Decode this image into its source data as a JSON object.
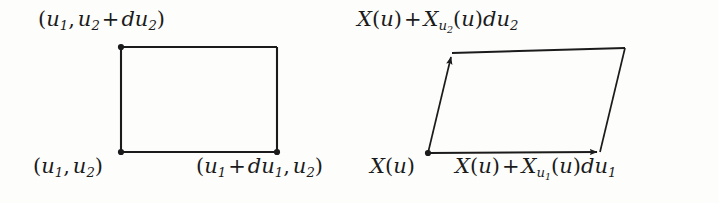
{
  "figure": {
    "background_color": "#fdfdfb",
    "stroke_color": "#1b1b1b"
  },
  "left_diagram": {
    "name": "parameter-domain-rectangle",
    "shape": "rectangle",
    "labels": {
      "top_left": "(u1, u2 + du2)",
      "bottom_left": "(u1, u2)",
      "bottom_right": "(u1 + du1, u2)"
    },
    "geometry": {
      "x_left": 121,
      "x_right": 277,
      "y_top": 47,
      "y_bottom": 152,
      "corner_dot_radius": 3
    }
  },
  "right_diagram": {
    "name": "tangent-plane-parallelogram",
    "shape": "parallelogram",
    "labels": {
      "top_left": "X(u) + Xu2(u)du2",
      "bottom_left": "X(u)",
      "bottom_right": "X(u) + Xu1(u)du1"
    },
    "geometry": {
      "bottom_left": [
        428,
        153
      ],
      "bottom_right": [
        600,
        152
      ],
      "top_left": [
        452,
        53
      ],
      "top_right": [
        625,
        48
      ],
      "arrow_edges": [
        "bottom",
        "left"
      ],
      "corner_dot_radius": 3
    }
  },
  "symbols": {
    "u": "u",
    "X": "X",
    "d": "d",
    "plus": "+",
    "comma": ",",
    "open_paren": "(",
    "close_paren": ")",
    "sub_1": "1",
    "sub_2": "2"
  }
}
